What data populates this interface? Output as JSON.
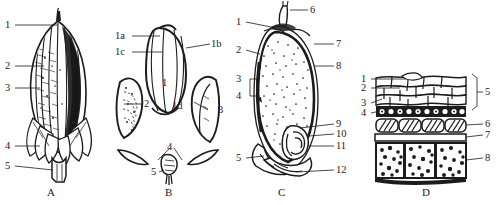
{
  "figure": {
    "background_color": "#ffffff",
    "ink_color": "#1c1c1c",
    "panel_count": 4
  },
  "panels": [
    {
      "caption": "A",
      "subject": "whole-grain-external-view",
      "labels": [
        {
          "text": "1",
          "side": "left"
        },
        {
          "text": "2",
          "side": "left"
        },
        {
          "text": "3",
          "side": "left"
        },
        {
          "text": "4",
          "side": "left"
        },
        {
          "text": "5",
          "side": "left"
        }
      ]
    },
    {
      "caption": "B",
      "subject": "dissected-grain-parts",
      "labels": [
        {
          "text": "1a",
          "side": "left"
        },
        {
          "text": "1c",
          "side": "left"
        },
        {
          "text": "1b",
          "side": "right"
        },
        {
          "text": "1",
          "side": "center"
        },
        {
          "text": "1d",
          "side": "right"
        },
        {
          "text": "2",
          "side": "right"
        },
        {
          "text": "3",
          "side": "right"
        },
        {
          "text": "4",
          "side": "center"
        },
        {
          "text": "5",
          "side": "left"
        }
      ]
    },
    {
      "caption": "C",
      "subject": "longitudinal-section",
      "labels": [
        {
          "text": "1",
          "side": "left"
        },
        {
          "text": "2",
          "side": "left"
        },
        {
          "text": "3",
          "side": "left"
        },
        {
          "text": "4",
          "side": "left"
        },
        {
          "text": "5",
          "side": "left"
        },
        {
          "text": "6",
          "side": "right"
        },
        {
          "text": "7",
          "side": "right"
        },
        {
          "text": "8",
          "side": "right"
        },
        {
          "text": "9",
          "side": "right"
        },
        {
          "text": "10",
          "side": "right"
        },
        {
          "text": "11",
          "side": "right"
        },
        {
          "text": "12",
          "side": "right"
        }
      ]
    },
    {
      "caption": "D",
      "subject": "pericarp-tissue-cross-section",
      "labels": [
        {
          "text": "1",
          "side": "left"
        },
        {
          "text": "2",
          "side": "left"
        },
        {
          "text": "3",
          "side": "left"
        },
        {
          "text": "4",
          "side": "left"
        },
        {
          "text": "5",
          "side": "right"
        },
        {
          "text": "6",
          "side": "right"
        },
        {
          "text": "7",
          "side": "right"
        },
        {
          "text": "8",
          "side": "right"
        }
      ]
    }
  ]
}
